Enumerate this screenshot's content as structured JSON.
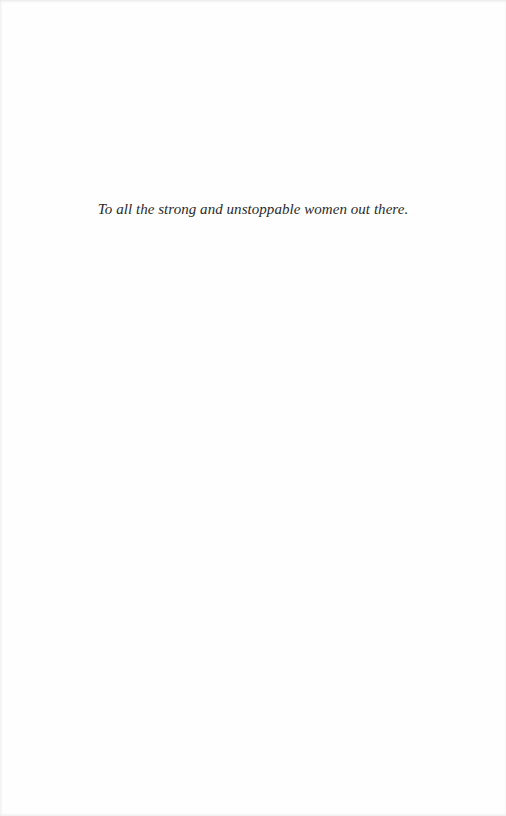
{
  "page": {
    "type": "dedication",
    "dedication_text": "To all the strong and unstoppable women out there."
  }
}
